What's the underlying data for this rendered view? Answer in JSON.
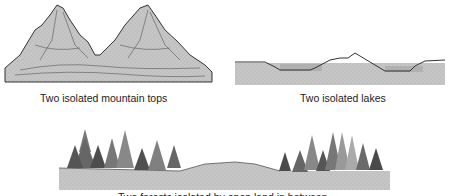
{
  "panels": [
    {
      "id": "mountains",
      "caption": "Two isolated mountain tops"
    },
    {
      "id": "lakes",
      "caption": "Two isolated lakes"
    },
    {
      "id": "forests",
      "caption": "Two forests isolated by open land in between"
    }
  ],
  "colors": {
    "ground": "#c4c4c4",
    "outline": "#3a3a3a",
    "tree_dark": "#555555",
    "tree_light": "#8a8a8a",
    "water": "#b8b8b8"
  }
}
